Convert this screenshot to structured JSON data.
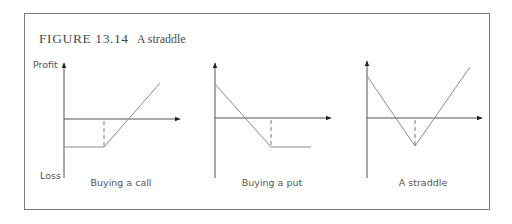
{
  "figure": {
    "number": "FIGURE 13.14",
    "caption": "A straddle"
  },
  "axis_labels": {
    "profit": "Profit",
    "loss": "Loss"
  },
  "colors": {
    "frame": "#7a7a7a",
    "axis": "#555555",
    "payoff_line": "#8a8a8a",
    "dashed": "#777777",
    "text": "#4a4a4a"
  },
  "chart_data": [
    {
      "type": "line",
      "title": "Buying a call",
      "xlabel": "Stock price",
      "ylabel": "Profit / Loss",
      "grid": false,
      "origin_px": [
        64,
        119
      ],
      "y_axis_px": [
        62,
        178
      ],
      "x_axis_end_px": 180,
      "strike_x": 40,
      "series": [
        {
          "name": "payoff",
          "x": [
            0,
            40,
            96
          ],
          "y": [
            -28,
            -28,
            36
          ]
        }
      ],
      "label_x_px": 121
    },
    {
      "type": "line",
      "title": "Buying a put",
      "xlabel": "Stock price",
      "ylabel": "Profit / Loss",
      "grid": false,
      "origin_px": [
        215,
        118
      ],
      "y_axis_px": [
        62,
        178
      ],
      "x_axis_end_px": 331,
      "strike_x": 56,
      "series": [
        {
          "name": "payoff",
          "x": [
            0,
            56,
            96
          ],
          "y": [
            34,
            -29,
            -29
          ]
        }
      ],
      "label_x_px": 272
    },
    {
      "type": "line",
      "title": "A straddle",
      "xlabel": "Stock price",
      "ylabel": "Profit / Loss",
      "grid": false,
      "origin_px": [
        367,
        118
      ],
      "y_axis_px": [
        60,
        178
      ],
      "x_axis_end_px": 482,
      "strike_x": 48,
      "series": [
        {
          "name": "payoff",
          "x": [
            0,
            48,
            103
          ],
          "y": [
            42,
            -28,
            51
          ]
        }
      ],
      "label_x_px": 423
    }
  ]
}
